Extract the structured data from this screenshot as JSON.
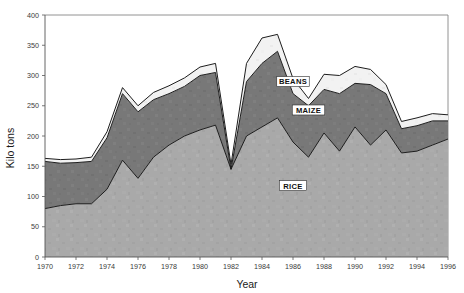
{
  "chart_data": {
    "type": "area",
    "stacked": true,
    "title": "",
    "xlabel": "Year",
    "ylabel": "Kilo tons",
    "xlim": [
      1970,
      1996
    ],
    "ylim": [
      0,
      400
    ],
    "ytick_step": 50,
    "xtick_step": 2,
    "grid": false,
    "legend_position": "inline-annotations",
    "x": [
      1970,
      1971,
      1972,
      1973,
      1974,
      1975,
      1976,
      1977,
      1978,
      1979,
      1980,
      1981,
      1982,
      1983,
      1984,
      1985,
      1986,
      1987,
      1988,
      1989,
      1990,
      1991,
      1992,
      1993,
      1994,
      1995,
      1996
    ],
    "xtick_labels": [
      "1970",
      "1972",
      "1974",
      "1976",
      "1978",
      "1980",
      "1982",
      "1984",
      "1986",
      "1988",
      "1990",
      "1992",
      "1994",
      "1996"
    ],
    "xticks": [
      1970,
      1972,
      1974,
      1976,
      1978,
      1980,
      1982,
      1984,
      1986,
      1988,
      1990,
      1992,
      1994,
      1996
    ],
    "ytick_labels": [
      "0",
      "50",
      "100",
      "150",
      "200",
      "250",
      "300",
      "350",
      "400"
    ],
    "yticks": [
      0,
      50,
      100,
      150,
      200,
      250,
      300,
      350,
      400
    ],
    "series": [
      {
        "name": "RICE",
        "color": "#a9a9a9",
        "values": [
          80,
          85,
          88,
          88,
          112,
          160,
          130,
          165,
          185,
          200,
          210,
          218,
          145,
          200,
          215,
          230,
          190,
          165,
          205,
          175,
          215,
          185,
          210,
          172,
          175,
          185,
          195
        ]
      },
      {
        "name": "MAIZE",
        "color": "#787878",
        "values": [
          78,
          70,
          68,
          70,
          85,
          110,
          110,
          95,
          85,
          82,
          90,
          87,
          0,
          90,
          105,
          110,
          80,
          85,
          72,
          95,
          72,
          100,
          60,
          40,
          42,
          40,
          30
        ]
      },
      {
        "name": "BEANS",
        "color": "#f2f2f2",
        "values": [
          5,
          6,
          6,
          7,
          10,
          10,
          10,
          12,
          13,
          14,
          14,
          15,
          8,
          30,
          42,
          28,
          25,
          12,
          25,
          30,
          28,
          25,
          15,
          12,
          13,
          12,
          10
        ]
      }
    ],
    "series_annotations": [
      {
        "label": "BEANS",
        "x": 1986,
        "y": 290
      },
      {
        "label": "MAIZE",
        "x": 1987,
        "y": 243
      },
      {
        "label": "RICE",
        "x": 1986,
        "y": 118
      }
    ]
  },
  "colors": {
    "background": "#ffffff",
    "axis": "#555555",
    "outline": "#1d1d1d",
    "text": "#222222",
    "rice": "#a9a9a9",
    "maize": "#787878",
    "beans": "#f2f2f2"
  }
}
